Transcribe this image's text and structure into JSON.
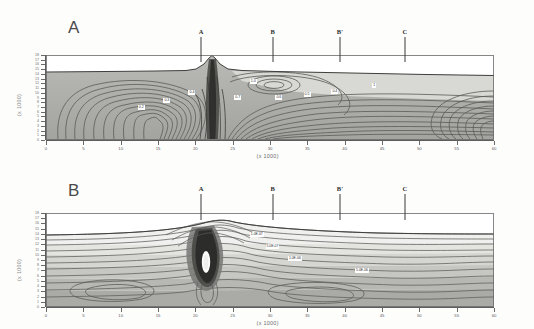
{
  "figure": {
    "panels": [
      {
        "id": "A",
        "letter": "A",
        "axis_title_y": "(x 1000)",
        "axis_title_x": "(x 1000)",
        "ylabel_values": [
          "18",
          "17",
          "16",
          "15",
          "14",
          "13",
          "12",
          "11",
          "10",
          "9",
          "8",
          "7",
          "6",
          "5",
          "4",
          "3",
          "2",
          "1",
          "0"
        ],
        "xlabel_values": [
          "0",
          "5",
          "10",
          "15",
          "20",
          "25",
          "30",
          "35",
          "40",
          "45",
          "50",
          "55",
          "60"
        ],
        "markers": [
          {
            "label": "A",
            "x_frac": 0.345
          },
          {
            "label": "B",
            "x_frac": 0.505
          },
          {
            "label": "B'",
            "x_frac": 0.655
          },
          {
            "label": "C",
            "x_frac": 0.8
          }
        ],
        "contour_labels": [
          {
            "text": "0.2",
            "x_frac": 0.205,
            "y_frac": 0.585
          },
          {
            "text": "0.3",
            "x_frac": 0.262,
            "y_frac": 0.5
          },
          {
            "text": "0.4",
            "x_frac": 0.318,
            "y_frac": 0.415
          },
          {
            "text": "1.0",
            "x_frac": 0.455,
            "y_frac": 0.285
          },
          {
            "text": "0.7",
            "x_frac": 0.42,
            "y_frac": 0.468
          },
          {
            "text": "0.6",
            "x_frac": 0.512,
            "y_frac": 0.47
          },
          {
            "text": "0.5",
            "x_frac": 0.575,
            "y_frac": 0.43
          },
          {
            "text": "0.4",
            "x_frac": 0.637,
            "y_frac": 0.395
          },
          {
            "text": "1",
            "x_frac": 0.728,
            "y_frac": 0.33
          }
        ]
      },
      {
        "id": "B",
        "letter": "B",
        "axis_title_y": "(x 1000)",
        "axis_title_x": "(x 1000)",
        "ylabel_values": [
          "18",
          "17",
          "16",
          "15",
          "14",
          "13",
          "12",
          "11",
          "10",
          "9",
          "8",
          "7",
          "6",
          "5",
          "4",
          "3",
          "2",
          "1",
          "0"
        ],
        "xlabel_values": [
          "0",
          "5",
          "10",
          "15",
          "20",
          "25",
          "30",
          "35",
          "40",
          "45",
          "50",
          "55",
          "60"
        ],
        "markers": [
          {
            "label": "A",
            "x_frac": 0.345
          },
          {
            "label": "B",
            "x_frac": 0.505
          },
          {
            "label": "B'",
            "x_frac": 0.655
          },
          {
            "label": "C",
            "x_frac": 0.8
          }
        ],
        "contour_labels": [
          {
            "text": "1.0E-07",
            "x_frac": 0.455,
            "y_frac": 0.2
          },
          {
            "text": "5.0E-07",
            "x_frac": 0.49,
            "y_frac": 0.33
          },
          {
            "text": "1.0E-06",
            "x_frac": 0.54,
            "y_frac": 0.455
          },
          {
            "text": "5.0E-06",
            "x_frac": 0.69,
            "y_frac": 0.59
          }
        ]
      }
    ]
  },
  "chart_data": {
    "type": "heatmap",
    "title": "",
    "panels": [
      {
        "name": "A",
        "type": "contour",
        "xlabel": "(x 1000)",
        "ylabel": "(x 1000)",
        "xlim": [
          0,
          60
        ],
        "ylim": [
          0,
          18
        ],
        "xticks": [
          0,
          5,
          10,
          15,
          20,
          25,
          30,
          35,
          40,
          45,
          50,
          55,
          60
        ],
        "yticks": [
          0,
          1,
          2,
          3,
          4,
          5,
          6,
          7,
          8,
          9,
          10,
          11,
          12,
          13,
          14,
          15,
          16,
          17,
          18
        ],
        "grid": false,
        "legend": "none",
        "colormap": "grayscale",
        "contour_levels": [
          0.2,
          0.3,
          0.4,
          0.5,
          0.6,
          0.7,
          1.0
        ],
        "annotations": [
          "A",
          "B",
          "B'",
          "C"
        ],
        "description": "Grayscale contour cross-section with a sharp central peak near x=20 and nested closed contours to the left and right"
      },
      {
        "name": "B",
        "type": "contour",
        "xlabel": "(x 1000)",
        "ylabel": "(x 1000)",
        "xlim": [
          0,
          60
        ],
        "ylim": [
          0,
          18
        ],
        "xticks": [
          0,
          5,
          10,
          15,
          20,
          25,
          30,
          35,
          40,
          45,
          50,
          55,
          60
        ],
        "yticks": [
          0,
          1,
          2,
          3,
          4,
          5,
          6,
          7,
          8,
          9,
          10,
          11,
          12,
          13,
          14,
          15,
          16,
          17,
          18
        ],
        "grid": false,
        "legend": "none",
        "colormap": "grayscale",
        "contour_levels": [
          1e-07,
          5e-07,
          1e-06,
          5e-06
        ],
        "annotations": [
          "A",
          "B",
          "B'",
          "C"
        ],
        "description": "Grayscale contour cross-section with sub-horizontal stratified contours and a narrow dark vertical plume beneath marker A"
      }
    ]
  }
}
